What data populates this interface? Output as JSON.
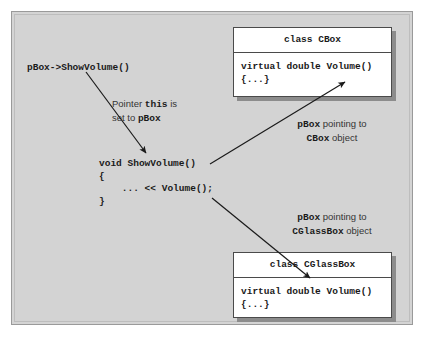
{
  "diagram": {
    "background_color": "#d3d3d3",
    "frame_border_color": "#9a9a9a",
    "box_background_color": "#ffffff",
    "box_border_color": "#4a4a4a",
    "box_shadow_color": "#8c8c8c",
    "arrow_color": "#1a1a1a"
  },
  "call_site": {
    "text": "pBox->ShowVolume()"
  },
  "pointer_note": {
    "line1_prefix": "Pointer ",
    "line1_code": "this",
    "line1_suffix": " is",
    "line2_prefix": "set to ",
    "line2_code": "pBox"
  },
  "function_block": {
    "line1": "void ShowVolume()",
    "line2": "{",
    "line3": "    ... << Volume();",
    "line4": "}"
  },
  "cbox": {
    "header": "class CBox",
    "body_line1": "virtual double Volume()",
    "body_line2": "{...}"
  },
  "cglassbox": {
    "header": "class CGlassBox",
    "body_line1": "virtual double Volume()",
    "body_line2": "{...}"
  },
  "cbox_label": {
    "line1_code": "pBox",
    "line1_suffix": " pointing to",
    "line2_code": "CBox",
    "line2_suffix": " object"
  },
  "cglassbox_label": {
    "line1_code": "pBox",
    "line1_suffix": " pointing to",
    "line2_code": "CGlassBox",
    "line2_suffix": " object"
  }
}
